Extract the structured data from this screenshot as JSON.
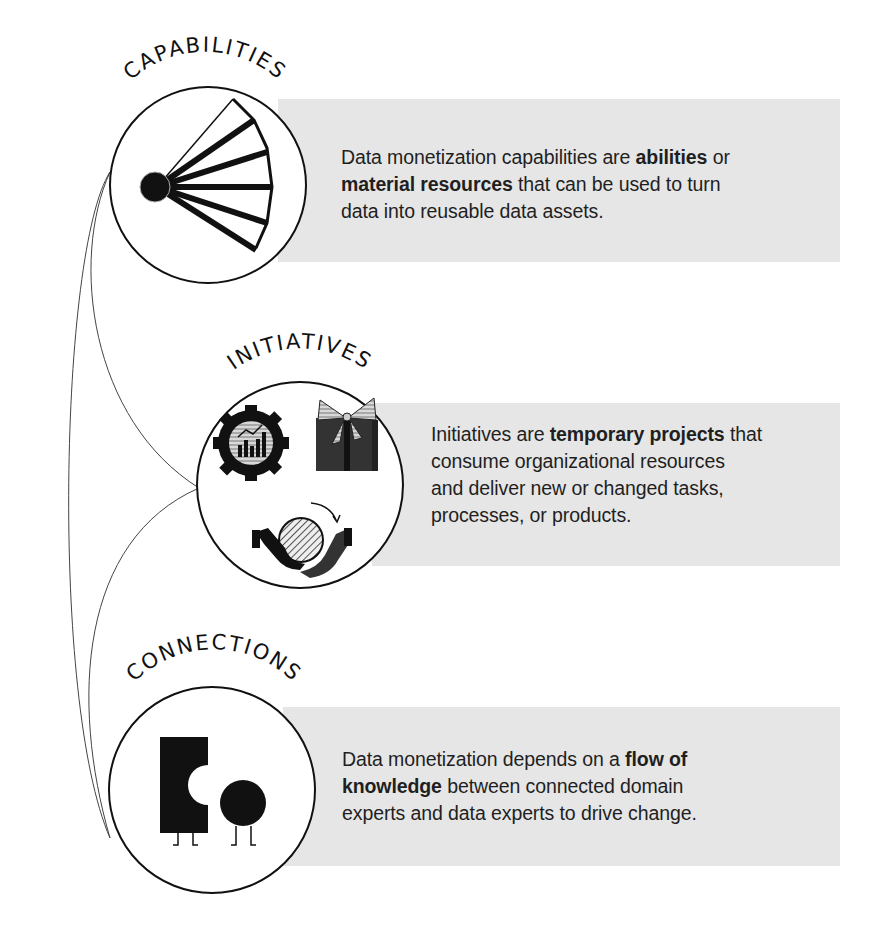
{
  "sections": [
    {
      "id": "capabilities",
      "title": "CAPABILITIES",
      "icon": "fan-icon",
      "description": {
        "line1_pre": "Data monetization capabilities are ",
        "line1_bold": "abilities",
        "line1_post": " or",
        "line2_bold": "material resources",
        "line2_post": " that can be used to turn",
        "line3": "data into reusable data assets."
      }
    },
    {
      "id": "initiatives",
      "title": "INITIATIVES",
      "icons": [
        "gear-chart-icon",
        "gift-box-icon",
        "handoff-icon"
      ],
      "description": {
        "line1_pre": "Initiatives are ",
        "line1_bold": "temporary projects",
        "line1_post": " that",
        "line2": "consume organizational resources",
        "line3": "and deliver new or changed tasks,",
        "line4": "processes, or products."
      }
    },
    {
      "id": "connections",
      "title": "CONNECTIONS",
      "icon": "two-characters-icon",
      "description": {
        "line1_pre": "Data monetization depends on a ",
        "line1_bold": "flow of",
        "line2_bold": "knowledge",
        "line2_post": " between connected domain",
        "line3": "experts and data experts to drive change."
      }
    }
  ],
  "colors": {
    "box_fill": "#e6e6e6",
    "ink": "#111111",
    "background": "#ffffff"
  }
}
